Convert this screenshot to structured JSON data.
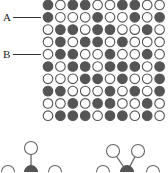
{
  "figure": {
    "labels": [
      {
        "text": "A",
        "row": 2
      },
      {
        "text": "B",
        "row": 5
      }
    ],
    "grid": {
      "rows": 10,
      "cols": 10,
      "origin_x": 48,
      "origin_y": 5,
      "spacing_x": 12.4,
      "spacing_y": 12.3,
      "radius": 4.8,
      "filled_color": "#555555",
      "stroke_color": "#555555",
      "cells": [
        [
          1,
          0,
          1,
          1,
          0,
          0,
          1,
          1,
          0,
          0
        ],
        [
          1,
          0,
          0,
          0,
          1,
          0,
          0,
          1,
          0,
          1
        ],
        [
          0,
          1,
          1,
          0,
          1,
          1,
          0,
          0,
          1,
          0
        ],
        [
          0,
          1,
          0,
          1,
          1,
          0,
          1,
          0,
          0,
          0
        ],
        [
          0,
          1,
          1,
          0,
          0,
          1,
          0,
          0,
          1,
          0
        ],
        [
          1,
          0,
          1,
          1,
          0,
          1,
          1,
          1,
          0,
          1
        ],
        [
          0,
          0,
          0,
          1,
          1,
          0,
          1,
          0,
          0,
          1
        ],
        [
          1,
          1,
          0,
          0,
          0,
          1,
          0,
          1,
          0,
          1
        ],
        [
          0,
          0,
          1,
          0,
          1,
          1,
          0,
          0,
          1,
          0
        ],
        [
          0,
          1,
          1,
          1,
          0,
          1,
          1,
          0,
          1,
          0
        ]
      ]
    },
    "molecules": [
      {
        "name": "left-molecule",
        "center": [
          31,
          172
        ],
        "bonded": [
          [
            31,
            148
          ]
        ],
        "side": [
          [
            8,
            172
          ],
          [
            55,
            172
          ]
        ]
      },
      {
        "name": "right-molecule",
        "center": [
          127,
          172
        ],
        "bonded": [
          [
            113,
            151
          ],
          [
            138,
            151
          ]
        ],
        "side": [
          [
            103,
            172
          ],
          [
            153,
            172
          ]
        ]
      }
    ]
  }
}
